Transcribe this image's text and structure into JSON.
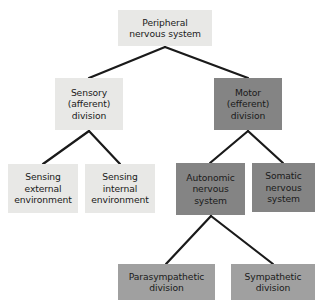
{
  "diagram": {
    "type": "hierarchy-tree",
    "colors": {
      "light_gray": "#e8e8e6",
      "medium_gray": "#a0a0a0",
      "dark_gray": "#848484",
      "connector": "#1a1a1a",
      "text": "#1a1a1a",
      "background": "#ffffff"
    },
    "nodes": [
      {
        "id": "peripheral-nervous-system",
        "label": "Peripheral\nnervous system",
        "tone": "light",
        "x": 118,
        "y": 10,
        "w": 94,
        "h": 36,
        "level": 0
      },
      {
        "id": "sensory-afferent-division",
        "label": "Sensory\n(afferent)\ndivision",
        "tone": "light",
        "x": 55,
        "y": 78,
        "w": 68,
        "h": 52,
        "level": 1
      },
      {
        "id": "motor-efferent-division",
        "label": "Motor\n(efferent)\ndivision",
        "tone": "dark",
        "x": 214,
        "y": 78,
        "w": 68,
        "h": 52,
        "level": 1
      },
      {
        "id": "sensing-external-environment",
        "label": "Sensing\nexternal\nenvironment",
        "tone": "light",
        "x": 8,
        "y": 164,
        "w": 70,
        "h": 49,
        "level": 2
      },
      {
        "id": "sensing-internal-environment",
        "label": "Sensing\ninternal\nenvironment",
        "tone": "light",
        "x": 85,
        "y": 164,
        "w": 70,
        "h": 49,
        "level": 2
      },
      {
        "id": "autonomic-nervous-system",
        "label": "Autonomic\nnervous\nsystem",
        "tone": "dark",
        "x": 176,
        "y": 163,
        "w": 69,
        "h": 52,
        "level": 2
      },
      {
        "id": "somatic-nervous-system",
        "label": "Somatic\nnervous\nsystem",
        "tone": "dark",
        "x": 252,
        "y": 163,
        "w": 63,
        "h": 49,
        "level": 2
      },
      {
        "id": "parasympathetic-division",
        "label": "Parasympathetic\ndivision",
        "tone": "medium",
        "x": 118,
        "y": 264,
        "w": 97,
        "h": 36,
        "level": 3
      },
      {
        "id": "sympathetic-division",
        "label": "Sympathetic\ndivision",
        "tone": "medium",
        "x": 231,
        "y": 264,
        "w": 84,
        "h": 36,
        "level": 3
      }
    ],
    "connectors": [
      {
        "id": "root-to-sensory",
        "from": "peripheral-nervous-system",
        "to": "sensory-afferent-division",
        "apex_x": 165,
        "apex_y": 47,
        "end_x": 89,
        "end_y": 78
      },
      {
        "id": "root-to-motor",
        "from": "peripheral-nervous-system",
        "to": "motor-efferent-division",
        "apex_x": 165,
        "apex_y": 47,
        "end_x": 248,
        "end_y": 78
      },
      {
        "id": "sensory-to-external",
        "from": "sensory-afferent-division",
        "to": "sensing-external-environment",
        "apex_x": 89,
        "apex_y": 131,
        "end_x": 43,
        "end_y": 164
      },
      {
        "id": "sensory-to-internal",
        "from": "sensory-afferent-division",
        "to": "sensing-internal-environment",
        "apex_x": 89,
        "apex_y": 131,
        "end_x": 120,
        "end_y": 164
      },
      {
        "id": "motor-to-autonomic",
        "from": "motor-efferent-division",
        "to": "autonomic-nervous-system",
        "apex_x": 248,
        "apex_y": 131,
        "end_x": 210,
        "end_y": 163
      },
      {
        "id": "motor-to-somatic",
        "from": "motor-efferent-division",
        "to": "somatic-nervous-system",
        "apex_x": 248,
        "apex_y": 131,
        "end_x": 283,
        "end_y": 163
      },
      {
        "id": "autonomic-to-parasympathetic",
        "from": "autonomic-nervous-system",
        "to": "parasympathetic-division",
        "apex_x": 211,
        "apex_y": 216,
        "end_x": 166,
        "end_y": 264
      },
      {
        "id": "autonomic-to-sympathetic",
        "from": "autonomic-nervous-system",
        "to": "sympathetic-division",
        "apex_x": 211,
        "apex_y": 216,
        "end_x": 273,
        "end_y": 264
      }
    ]
  }
}
